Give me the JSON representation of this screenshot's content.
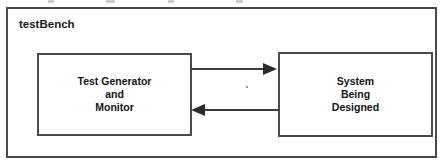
{
  "diagram": {
    "frame": {
      "label": "testBench",
      "border_color": "#4a4a4a",
      "background_color": "#ffffff"
    },
    "blocks": [
      {
        "id": "test-generator-and-monitor",
        "label": "Test Generator\nand\nMonitor",
        "border_color": "#4a4a4a",
        "background_color": "#ffffff"
      },
      {
        "id": "system-being-designed",
        "label": "System\nBeing\nDesigned",
        "border_color": "#4a4a4a",
        "background_color": "#ffffff"
      }
    ],
    "connectors": [
      {
        "id": "stimulus",
        "from": "test-generator-and-monitor",
        "to": "system-being-designed",
        "direction": "right",
        "label": "",
        "color": "#2b2b2b"
      },
      {
        "id": "response",
        "from": "system-being-designed",
        "to": "test-generator-and-monitor",
        "direction": "left",
        "label": "",
        "color": "#2b2b2b"
      }
    ]
  }
}
